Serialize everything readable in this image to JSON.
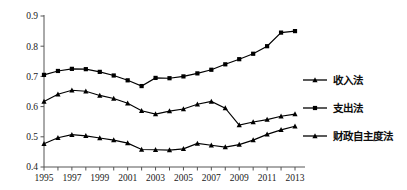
{
  "chart_data": {
    "type": "line",
    "title": "",
    "xlabel": "",
    "ylabel": "",
    "xlim": [
      1995,
      2013
    ],
    "ylim": [
      0.4,
      0.9
    ],
    "grid": false,
    "legend_position": "right",
    "x": [
      1995,
      1996,
      1997,
      1998,
      1999,
      2000,
      2001,
      2002,
      2003,
      2004,
      2005,
      2006,
      2007,
      2008,
      2009,
      2010,
      2011,
      2012,
      2013
    ],
    "xtick_labels": [
      "1995",
      "1997",
      "1999",
      "2001",
      "2003",
      "2005",
      "2007",
      "2009",
      "2011",
      "2013"
    ],
    "xtick_values": [
      1995,
      1997,
      1999,
      2001,
      2003,
      2005,
      2007,
      2009,
      2011,
      2013
    ],
    "ytick_labels": [
      "0.4",
      "0.5",
      "0.6",
      "0.7",
      "0.8",
      "0.9"
    ],
    "ytick_values": [
      0.4,
      0.5,
      0.6,
      0.7,
      0.8,
      0.9
    ],
    "series": [
      {
        "name": "收入法",
        "marker": "square",
        "color": "#000000",
        "values": [
          0.705,
          0.718,
          0.725,
          0.724,
          0.715,
          0.703,
          0.687,
          0.668,
          0.695,
          0.694,
          0.7,
          0.71,
          0.722,
          0.74,
          0.757,
          0.775,
          0.8,
          0.845,
          0.85
        ]
      },
      {
        "name": "支出法",
        "marker": "triangle",
        "color": "#000000",
        "values": [
          0.617,
          0.641,
          0.654,
          0.651,
          0.637,
          0.627,
          0.611,
          0.586,
          0.575,
          0.585,
          0.592,
          0.608,
          0.617,
          0.595,
          0.539,
          0.549,
          0.557,
          0.568,
          0.575
        ]
      },
      {
        "name": "财政自主度法",
        "marker": "triangle",
        "color": "#000000",
        "values": [
          0.477,
          0.497,
          0.507,
          0.503,
          0.496,
          0.489,
          0.479,
          0.458,
          0.457,
          0.456,
          0.46,
          0.478,
          0.472,
          0.466,
          0.474,
          0.489,
          0.508,
          0.523,
          0.535
        ]
      }
    ]
  },
  "legend": {
    "entries": [
      {
        "label": "收入法",
        "marker": "triangle"
      },
      {
        "label": "支出法",
        "marker": "square"
      },
      {
        "label": "财政自主度法",
        "marker": "triangle"
      }
    ]
  }
}
